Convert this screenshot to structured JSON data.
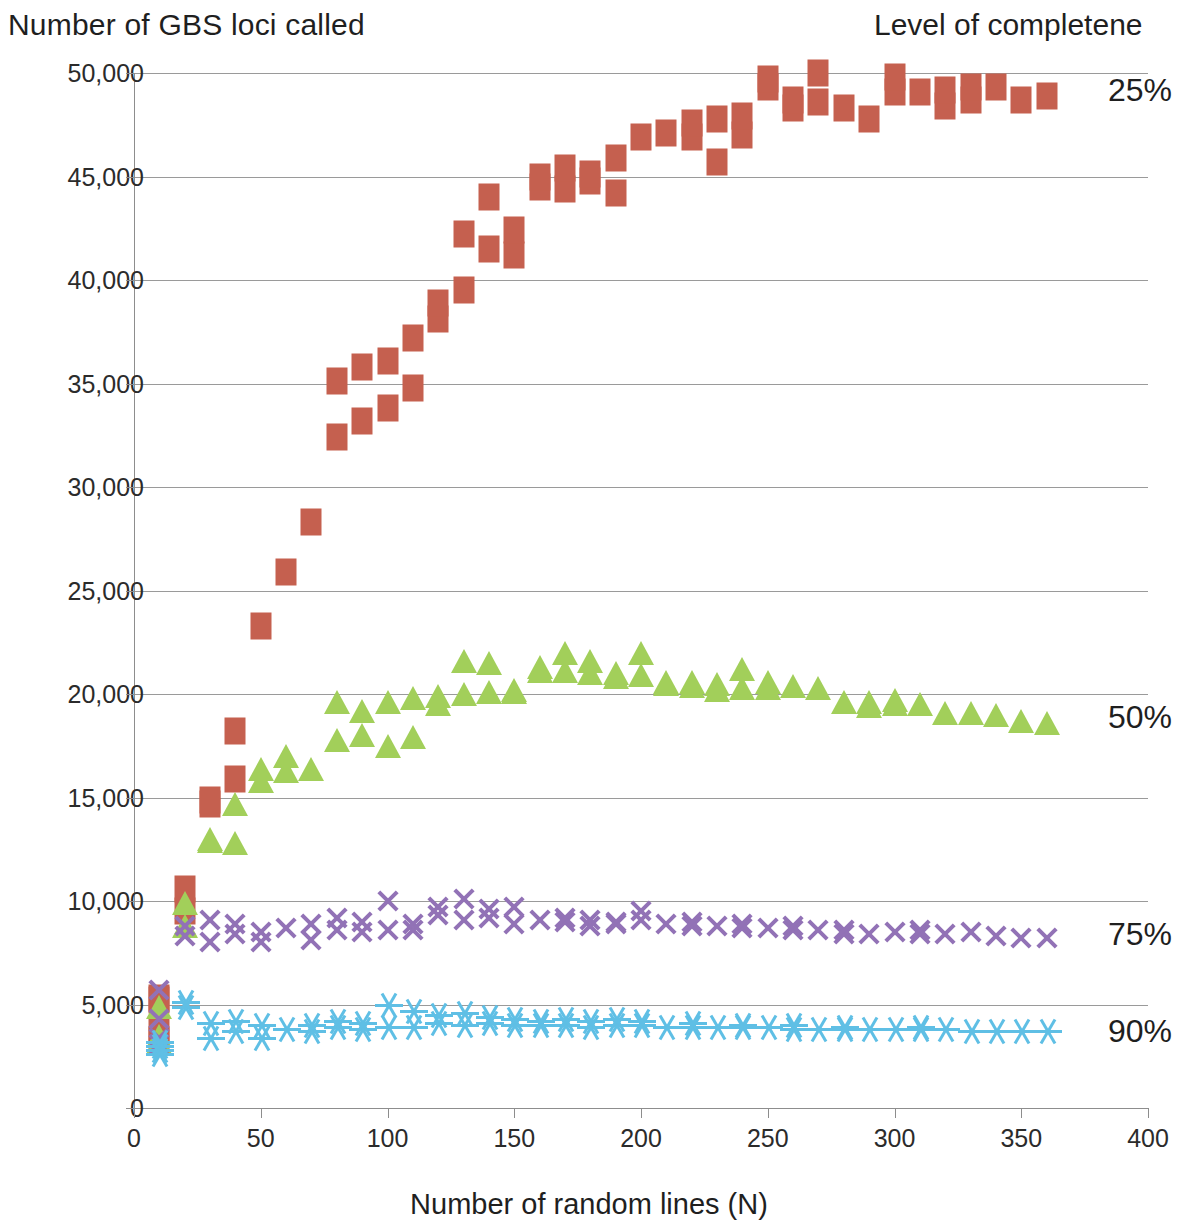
{
  "axes": {
    "y_title": "Number of GBS loci called",
    "x_title": "Number of random lines (N)",
    "y_ticks": [
      "50,000",
      "45,000",
      "40,000",
      "35,000",
      "30,000",
      "25,000",
      "20,000",
      "15,000",
      "10,000",
      "5,000",
      "0"
    ],
    "x_ticks": [
      "0",
      "50",
      "100",
      "150",
      "200",
      "250",
      "300",
      "350",
      "400"
    ]
  },
  "legend": {
    "title": "Level of completene",
    "items": [
      {
        "label": "25%",
        "color": "#c5604f"
      },
      {
        "label": "50%",
        "color": "#a2cf5a"
      },
      {
        "label": "75%",
        "color": "#9272b6"
      },
      {
        "label": "90%",
        "color": "#5fbfe5"
      }
    ]
  },
  "chart_data": {
    "type": "scatter",
    "title": "Number of GBS loci called",
    "xlabel": "Number of random lines (N)",
    "ylabel": "Number of GBS loci called",
    "xlim": [
      0,
      400
    ],
    "ylim": [
      0,
      50000
    ],
    "xticks": [
      0,
      50,
      100,
      150,
      200,
      250,
      300,
      350,
      400
    ],
    "yticks": [
      0,
      5000,
      10000,
      15000,
      20000,
      25000,
      30000,
      35000,
      40000,
      45000,
      50000
    ],
    "grid": "horizontal",
    "legend_position": "right",
    "legend_title": "Level of completeness",
    "series": [
      {
        "name": "25%",
        "color": "#c5604f",
        "marker": "square",
        "points": [
          [
            10,
            3300
          ],
          [
            10,
            3700
          ],
          [
            10,
            5200
          ],
          [
            10,
            5300
          ],
          [
            20,
            9500
          ],
          [
            20,
            10600
          ],
          [
            30,
            14700
          ],
          [
            30,
            14900
          ],
          [
            40,
            15900
          ],
          [
            40,
            18200
          ],
          [
            50,
            23300
          ],
          [
            60,
            25900
          ],
          [
            70,
            28300
          ],
          [
            80,
            32400
          ],
          [
            80,
            35100
          ],
          [
            90,
            33200
          ],
          [
            90,
            35800
          ],
          [
            100,
            33800
          ],
          [
            100,
            36100
          ],
          [
            110,
            34800
          ],
          [
            110,
            37200
          ],
          [
            120,
            38100
          ],
          [
            120,
            38900
          ],
          [
            130,
            39500
          ],
          [
            130,
            42200
          ],
          [
            140,
            41500
          ],
          [
            140,
            44000
          ],
          [
            150,
            41200
          ],
          [
            150,
            42400
          ],
          [
            160,
            44500
          ],
          [
            160,
            45000
          ],
          [
            170,
            44400
          ],
          [
            170,
            45400
          ],
          [
            180,
            44800
          ],
          [
            180,
            45100
          ],
          [
            190,
            44200
          ],
          [
            190,
            45900
          ],
          [
            200,
            46900
          ],
          [
            210,
            47100
          ],
          [
            220,
            46900
          ],
          [
            220,
            47600
          ],
          [
            230,
            45700
          ],
          [
            230,
            47800
          ],
          [
            240,
            47000
          ],
          [
            240,
            47900
          ],
          [
            250,
            49300
          ],
          [
            250,
            49700
          ],
          [
            260,
            48300
          ],
          [
            260,
            48700
          ],
          [
            270,
            48600
          ],
          [
            270,
            50000
          ],
          [
            280,
            48300
          ],
          [
            290,
            47800
          ],
          [
            300,
            49100
          ],
          [
            300,
            49800
          ],
          [
            310,
            49100
          ],
          [
            320,
            48400
          ],
          [
            320,
            49200
          ],
          [
            330,
            48700
          ],
          [
            330,
            49300
          ],
          [
            340,
            49300
          ],
          [
            350,
            48700
          ],
          [
            360,
            48900
          ]
        ]
      },
      {
        "name": "50%",
        "color": "#a2cf5a",
        "marker": "triangle",
        "points": [
          [
            10,
            3200
          ],
          [
            10,
            3500
          ],
          [
            10,
            4900
          ],
          [
            20,
            8800
          ],
          [
            20,
            9900
          ],
          [
            30,
            12900
          ],
          [
            30,
            13000
          ],
          [
            40,
            12800
          ],
          [
            40,
            14700
          ],
          [
            50,
            15800
          ],
          [
            50,
            16400
          ],
          [
            60,
            16300
          ],
          [
            60,
            17000
          ],
          [
            70,
            16400
          ],
          [
            80,
            17800
          ],
          [
            80,
            19600
          ],
          [
            90,
            18000
          ],
          [
            90,
            19200
          ],
          [
            100,
            17500
          ],
          [
            100,
            19600
          ],
          [
            110,
            17900
          ],
          [
            110,
            19800
          ],
          [
            120,
            19500
          ],
          [
            120,
            19900
          ],
          [
            130,
            20000
          ],
          [
            130,
            21600
          ],
          [
            140,
            20100
          ],
          [
            140,
            21500
          ],
          [
            150,
            20100
          ],
          [
            150,
            20200
          ],
          [
            160,
            21100
          ],
          [
            160,
            21300
          ],
          [
            170,
            21100
          ],
          [
            170,
            22000
          ],
          [
            180,
            21000
          ],
          [
            180,
            21600
          ],
          [
            190,
            20800
          ],
          [
            190,
            21000
          ],
          [
            200,
            20900
          ],
          [
            200,
            22000
          ],
          [
            210,
            20500
          ],
          [
            210,
            20600
          ],
          [
            220,
            20400
          ],
          [
            220,
            20600
          ],
          [
            230,
            20200
          ],
          [
            230,
            20500
          ],
          [
            240,
            20300
          ],
          [
            240,
            21200
          ],
          [
            250,
            20300
          ],
          [
            250,
            20600
          ],
          [
            260,
            20400
          ],
          [
            270,
            20300
          ],
          [
            280,
            19600
          ],
          [
            290,
            19400
          ],
          [
            290,
            19600
          ],
          [
            300,
            19500
          ],
          [
            300,
            19700
          ],
          [
            310,
            19500
          ],
          [
            320,
            19100
          ],
          [
            330,
            19100
          ],
          [
            340,
            19000
          ],
          [
            350,
            18700
          ],
          [
            360,
            18600
          ]
        ]
      },
      {
        "name": "75%",
        "color": "#9272b6",
        "marker": "x",
        "points": [
          [
            10,
            3100
          ],
          [
            10,
            3400
          ],
          [
            10,
            4300
          ],
          [
            10,
            5700
          ],
          [
            20,
            8300
          ],
          [
            20,
            8800
          ],
          [
            30,
            8000
          ],
          [
            30,
            9100
          ],
          [
            40,
            8400
          ],
          [
            40,
            8900
          ],
          [
            50,
            8000
          ],
          [
            50,
            8500
          ],
          [
            60,
            8700
          ],
          [
            70,
            8100
          ],
          [
            70,
            8900
          ],
          [
            80,
            8600
          ],
          [
            80,
            9200
          ],
          [
            90,
            8500
          ],
          [
            90,
            9000
          ],
          [
            100,
            8600
          ],
          [
            100,
            10000
          ],
          [
            110,
            8600
          ],
          [
            110,
            8900
          ],
          [
            120,
            9300
          ],
          [
            120,
            9700
          ],
          [
            130,
            9100
          ],
          [
            130,
            10100
          ],
          [
            140,
            9200
          ],
          [
            140,
            9600
          ],
          [
            150,
            8900
          ],
          [
            150,
            9700
          ],
          [
            160,
            9100
          ],
          [
            170,
            9000
          ],
          [
            170,
            9200
          ],
          [
            180,
            8800
          ],
          [
            180,
            9100
          ],
          [
            190,
            8900
          ],
          [
            190,
            9000
          ],
          [
            200,
            9100
          ],
          [
            200,
            9500
          ],
          [
            210,
            8900
          ],
          [
            220,
            8800
          ],
          [
            220,
            9000
          ],
          [
            230,
            8800
          ],
          [
            240,
            8700
          ],
          [
            240,
            8900
          ],
          [
            250,
            8700
          ],
          [
            260,
            8600
          ],
          [
            260,
            8800
          ],
          [
            270,
            8600
          ],
          [
            280,
            8400
          ],
          [
            280,
            8600
          ],
          [
            290,
            8400
          ],
          [
            300,
            8500
          ],
          [
            310,
            8400
          ],
          [
            310,
            8600
          ],
          [
            320,
            8400
          ],
          [
            330,
            8500
          ],
          [
            340,
            8300
          ],
          [
            350,
            8200
          ],
          [
            360,
            8200
          ]
        ]
      },
      {
        "name": "90%",
        "color": "#5fbfe5",
        "marker": "star",
        "points": [
          [
            10,
            2600
          ],
          [
            10,
            2800
          ],
          [
            10,
            3000
          ],
          [
            10,
            3200
          ],
          [
            20,
            4900
          ],
          [
            20,
            5100
          ],
          [
            30,
            3400
          ],
          [
            30,
            4100
          ],
          [
            40,
            3700
          ],
          [
            40,
            4200
          ],
          [
            50,
            3400
          ],
          [
            50,
            4000
          ],
          [
            60,
            3800
          ],
          [
            70,
            3700
          ],
          [
            70,
            4000
          ],
          [
            80,
            3900
          ],
          [
            80,
            4200
          ],
          [
            90,
            3800
          ],
          [
            90,
            4100
          ],
          [
            100,
            3900
          ],
          [
            100,
            5000
          ],
          [
            110,
            3900
          ],
          [
            110,
            4700
          ],
          [
            120,
            4100
          ],
          [
            120,
            4500
          ],
          [
            130,
            4000
          ],
          [
            130,
            4600
          ],
          [
            140,
            4100
          ],
          [
            140,
            4400
          ],
          [
            150,
            4000
          ],
          [
            150,
            4300
          ],
          [
            160,
            4000
          ],
          [
            160,
            4200
          ],
          [
            170,
            4000
          ],
          [
            170,
            4300
          ],
          [
            180,
            3900
          ],
          [
            180,
            4200
          ],
          [
            190,
            4000
          ],
          [
            190,
            4300
          ],
          [
            200,
            4000
          ],
          [
            200,
            4200
          ],
          [
            210,
            3900
          ],
          [
            220,
            3900
          ],
          [
            220,
            4100
          ],
          [
            230,
            3900
          ],
          [
            240,
            3900
          ],
          [
            240,
            4000
          ],
          [
            250,
            3900
          ],
          [
            260,
            3800
          ],
          [
            260,
            4000
          ],
          [
            270,
            3800
          ],
          [
            280,
            3800
          ],
          [
            280,
            3900
          ],
          [
            290,
            3800
          ],
          [
            300,
            3800
          ],
          [
            310,
            3800
          ],
          [
            310,
            3900
          ],
          [
            320,
            3800
          ],
          [
            330,
            3700
          ],
          [
            340,
            3700
          ],
          [
            350,
            3700
          ],
          [
            360,
            3700
          ]
        ]
      }
    ]
  }
}
